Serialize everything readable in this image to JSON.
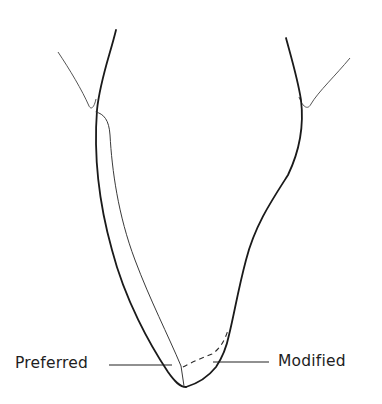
{
  "figure": {
    "labels": {
      "preferred": "Preferred",
      "modified": "Modified"
    },
    "colors": {
      "background": "#ffffff",
      "line": "#1a1a1a"
    }
  }
}
